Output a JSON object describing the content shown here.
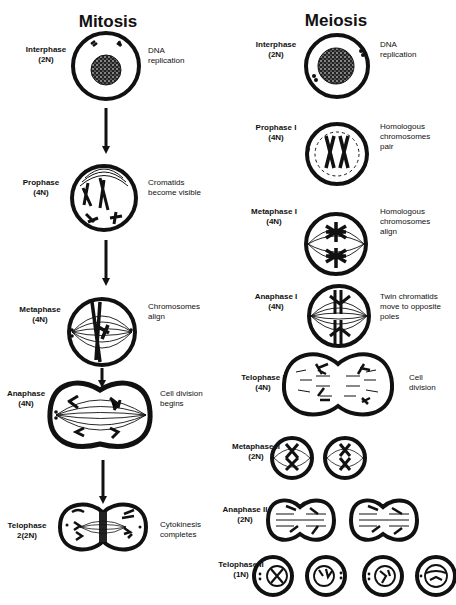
{
  "mitosis": {
    "title": "Mitosis",
    "stages": [
      {
        "name": "Interphase",
        "ploidy": "(2N)",
        "desc1": "DNA",
        "desc2": "replication",
        "desc3": ""
      },
      {
        "name": "Prophase",
        "ploidy": "(4N)",
        "desc1": "Cromatids",
        "desc2": "become visible",
        "desc3": ""
      },
      {
        "name": "Metaphase",
        "ploidy": "(4N)",
        "desc1": "Chromosomes",
        "desc2": "align",
        "desc3": ""
      },
      {
        "name": "Anaphase",
        "ploidy": "(4N)",
        "desc1": "Cell division",
        "desc2": "begins",
        "desc3": ""
      },
      {
        "name": "Telophase",
        "ploidy": "2(2N)",
        "desc1": "Cytokinesis",
        "desc2": "completes",
        "desc3": ""
      }
    ]
  },
  "meiosis": {
    "title": "Meiosis",
    "stages": [
      {
        "name": "Interphase",
        "ploidy": "(2N)",
        "desc1": "DNA",
        "desc2": "replication",
        "desc3": ""
      },
      {
        "name": "Prophase I",
        "ploidy": "(4N)",
        "desc1": "Homologous",
        "desc2": "chromosomes",
        "desc3": "pair"
      },
      {
        "name": "Metaphase I",
        "ploidy": "(4N)",
        "desc1": "Homologous",
        "desc2": "chromosomes",
        "desc3": "align"
      },
      {
        "name": "Anaphase I",
        "ploidy": "(4N)",
        "desc1": "Twin chromatids",
        "desc2": "move to opposite",
        "desc3": "poles"
      },
      {
        "name": "Telophase I",
        "ploidy": "(4N)",
        "desc1": "Cell",
        "desc2": "division",
        "desc3": ""
      },
      {
        "name": "Metaphase II",
        "ploidy": "(2N)",
        "desc1": "",
        "desc2": "",
        "desc3": ""
      },
      {
        "name": "Anaphase II",
        "ploidy": "(2N)",
        "desc1": "",
        "desc2": "",
        "desc3": ""
      },
      {
        "name": "Telophase II",
        "ploidy": "(1N)",
        "desc1": "",
        "desc2": "",
        "desc3": ""
      }
    ]
  },
  "colors": {
    "ink": "#111111",
    "background": "#ffffff"
  }
}
